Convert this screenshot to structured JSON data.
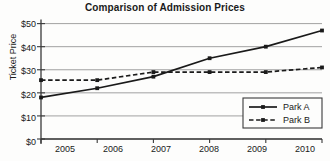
{
  "chart_data": {
    "type": "line",
    "title": "Comparison of Admission Prices",
    "xlabel": "",
    "ylabel": "Ticket Price",
    "categories": [
      "2005",
      "2006",
      "2007",
      "2008",
      "2009",
      "2010"
    ],
    "x": [
      2005,
      2006,
      2007,
      2008,
      2009,
      2010
    ],
    "ylim": [
      0,
      50
    ],
    "xlim": [
      2005,
      2010
    ],
    "ytick_labels": [
      "$0",
      "$10",
      "$20",
      "$30",
      "$40",
      "$50"
    ],
    "ytick_values": [
      0,
      10,
      20,
      30,
      40,
      50
    ],
    "grid": true,
    "grid_axis": "y",
    "legend_position": "bottom-right",
    "series": [
      {
        "name": "Park A",
        "values": [
          18,
          22,
          27,
          35,
          40,
          47
        ],
        "line_style": "solid",
        "color": "#1a1a1a",
        "marker": "square"
      },
      {
        "name": "Park B",
        "values": [
          25.5,
          25.5,
          29,
          29,
          29,
          31
        ],
        "line_style": "dashed",
        "color": "#1a1a1a",
        "marker": "square"
      }
    ]
  },
  "legend": {
    "items": [
      {
        "label": "Park A",
        "style": "solid"
      },
      {
        "label": "Park B",
        "style": "dashed"
      }
    ]
  },
  "colors": {
    "axis": "#3a3a3a",
    "grid": "#8a8a8a",
    "series": "#1a1a1a",
    "background": "#fdfdfc",
    "text": "#1a1a1a"
  }
}
